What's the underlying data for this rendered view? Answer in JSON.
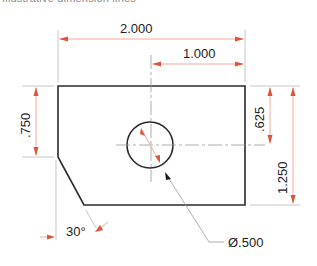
{
  "caption": "Illustrative dimension lines",
  "dimensions": {
    "overall_width": "2.000",
    "hole_offset_x": "1.000",
    "left_edge_height": ".750",
    "hole_offset_y": ".625",
    "overall_height": "1.250",
    "chamfer_angle": "30°",
    "hole_diameter": "Ø.500"
  },
  "colors": {
    "object_line": "#2b2b2b",
    "dimension_line": "#f0a090",
    "arrowhead": "#e0553a",
    "extension_line": "#b8b8b8"
  }
}
